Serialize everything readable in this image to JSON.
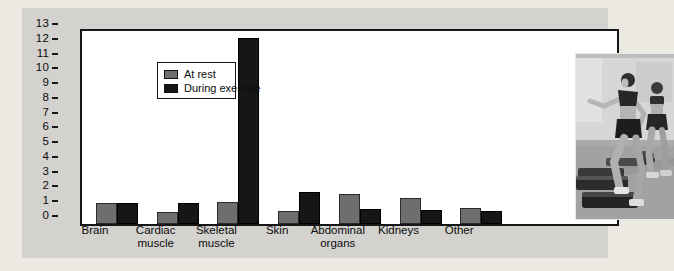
{
  "figure": {
    "page_background": "#ece9e2",
    "panel_background": "#d3d2cf"
  },
  "chart_data": {
    "type": "bar",
    "title": "",
    "xlabel": "",
    "ylabel": "Blood flow (L/min)",
    "ylim": [
      0,
      13
    ],
    "yticks": [
      0,
      1,
      2,
      3,
      4,
      5,
      6,
      7,
      8,
      9,
      10,
      11,
      12,
      13
    ],
    "grid": false,
    "legend_position": "top-left",
    "plot_background": "#ffffff",
    "categories": [
      "Brain",
      "Cardiac muscle",
      "Skeletal muscle",
      "Skin",
      "Abdominal organs",
      "Kidneys",
      "Other"
    ],
    "series": [
      {
        "name": "At rest",
        "color": "#6e6e6e",
        "values": [
          1.4,
          0.8,
          1.5,
          0.9,
          2.0,
          1.75,
          1.1
        ]
      },
      {
        "name": "During exercise",
        "color": "#161616",
        "values": [
          1.4,
          1.4,
          12.6,
          2.2,
          1.0,
          0.95,
          0.9
        ]
      }
    ]
  },
  "legend": {
    "items": [
      {
        "label": "At rest",
        "color": "#6e6e6e"
      },
      {
        "label": "During exercise",
        "color": "#161616"
      }
    ]
  },
  "photo": {
    "description": "black-and-white photo of two women doing step aerobics in a gym"
  }
}
